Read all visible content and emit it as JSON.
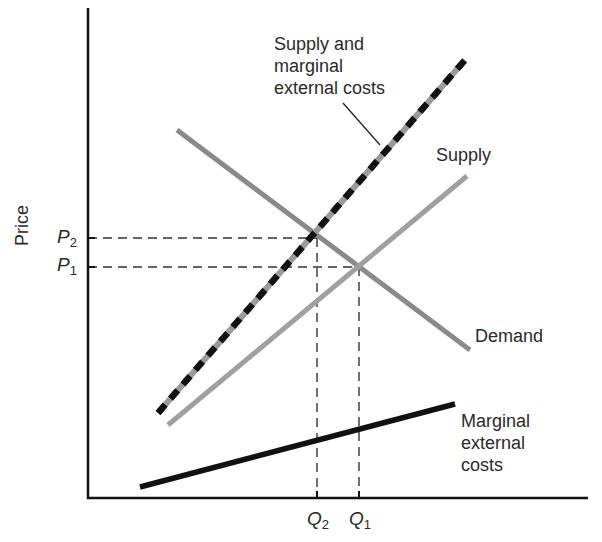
{
  "diagram": {
    "type": "supply-demand-externality",
    "axes": {
      "y_label": "Price",
      "x_label": ""
    },
    "ticks": {
      "p2": {
        "symbol": "P",
        "sub": "2"
      },
      "p1": {
        "symbol": "P",
        "sub": "1"
      },
      "q2": {
        "symbol": "Q",
        "sub": "2"
      },
      "q1": {
        "symbol": "Q",
        "sub": "1"
      }
    },
    "curves": [
      {
        "id": "supply_mec",
        "label_lines": [
          "Supply and",
          "marginal",
          "external costs"
        ],
        "style": "dashed black/gray",
        "color_a": "#111111",
        "color_b": "#9a9a9a"
      },
      {
        "id": "supply",
        "label_lines": [
          "Supply"
        ],
        "style": "solid",
        "color": "#a0a0a0"
      },
      {
        "id": "demand",
        "label_lines": [
          "Demand"
        ],
        "style": "solid",
        "color": "#8a8a8a"
      },
      {
        "id": "mec",
        "label_lines": [
          "Marginal",
          "external",
          "costs"
        ],
        "style": "solid",
        "color": "#111111"
      }
    ],
    "equilibria": [
      {
        "name": "social optimum",
        "price": "P2",
        "quantity": "Q2"
      },
      {
        "name": "market equilibrium",
        "price": "P1",
        "quantity": "Q1"
      }
    ]
  }
}
